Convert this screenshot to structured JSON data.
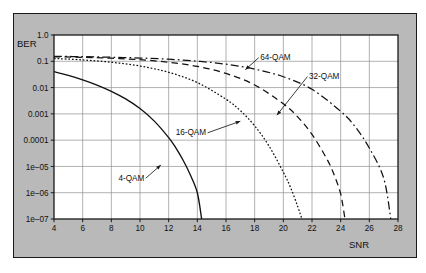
{
  "figure": {
    "background_color": "#b9b9b9",
    "plot_background_color": "#ffffff",
    "grid_color": "#8f8f8f",
    "axis_color": "#1a1a1a",
    "curve_color": "#111111"
  },
  "chart_data": {
    "type": "line",
    "title": "",
    "xlabel": "SNR",
    "ylabel": "BER",
    "xlim": [
      4,
      28
    ],
    "ylim": [
      1e-07,
      1.0
    ],
    "yscale": "log",
    "grid": true,
    "legend_position": "inline-annotations",
    "xticks": [
      4,
      6,
      8,
      10,
      12,
      14,
      16,
      18,
      20,
      22,
      24,
      26,
      28
    ],
    "xtick_labels": [
      "4",
      "6",
      "8",
      "10",
      "12",
      "14",
      "16",
      "18",
      "20",
      "22",
      "24",
      "26",
      "28"
    ],
    "yticks": [
      1.0,
      0.1,
      0.01,
      0.001,
      0.0001,
      1e-05,
      1e-06,
      1e-07
    ],
    "ytick_labels": [
      "1.0",
      "0.1",
      "0.01",
      "0.001",
      "0.0001",
      "1e–05",
      "1e–06",
      "1e–07"
    ],
    "series": [
      {
        "name": "4-QAM",
        "linestyle": "solid",
        "x": [
          4,
          5,
          6,
          7,
          8,
          9,
          10,
          11,
          12,
          12.5,
          13,
          13.5,
          14,
          14.3
        ],
        "y": [
          0.0404,
          0.029,
          0.0197,
          0.0125,
          0.0072,
          0.0037,
          0.00159,
          0.00053,
          0.000125,
          5.1e-05,
          1.76e-05,
          4.9e-06,
          1e-06,
          1e-07
        ]
      },
      {
        "name": "16-QAM",
        "linestyle": "dotted",
        "x": [
          4,
          6,
          8,
          10,
          12,
          14,
          16,
          17,
          18,
          19,
          20,
          20.5,
          21,
          21.3
        ],
        "y": [
          0.128,
          0.113,
          0.092,
          0.066,
          0.038,
          0.0155,
          0.0036,
          0.00133,
          0.00035,
          6e-05,
          6e-06,
          1.6e-06,
          3e-07,
          1e-07
        ]
      },
      {
        "name": "32-QAM",
        "linestyle": "dashed",
        "x": [
          4,
          6,
          8,
          10,
          12,
          14,
          16,
          18,
          20,
          21,
          22,
          23,
          23.5,
          24,
          24.3
        ],
        "y": [
          0.148,
          0.142,
          0.131,
          0.115,
          0.092,
          0.064,
          0.0345,
          0.0126,
          0.0024,
          0.00077,
          0.000165,
          2.1e-05,
          5.5e-06,
          9e-07,
          1e-07
        ]
      },
      {
        "name": "64-QAM",
        "linestyle": "dashdot",
        "x": [
          4,
          6,
          8,
          10,
          12,
          14,
          16,
          18,
          20,
          22,
          24,
          25,
          26,
          27,
          27.5
        ],
        "y": [
          0.155,
          0.15,
          0.143,
          0.133,
          0.12,
          0.101,
          0.0775,
          0.0505,
          0.0258,
          0.0086,
          0.00125,
          0.00033,
          5e-05,
          3.6e-06,
          1e-07
        ]
      }
    ],
    "annotations": [
      {
        "label": "64-QAM",
        "text_x": 19.45,
        "text_y_dec": 0.96,
        "arrow_to_x": 17.35,
        "arrow_to_y_dec": 1.32
      },
      {
        "label": "32-QAM",
        "text_x": 22.85,
        "text_y_dec": 1.68,
        "arrow_to_x": 19.55,
        "arrow_to_y_dec": 3.05
      },
      {
        "label": "16-QAM",
        "text_x": 13.55,
        "text_y_dec": 3.82,
        "arrow_to_x": 17.0,
        "arrow_to_y_dec": 3.28
      },
      {
        "label": "4-QAM",
        "text_x": 9.4,
        "text_y_dec": 5.55,
        "arrow_to_x": 11.45,
        "arrow_to_y_dec": 4.95
      }
    ]
  }
}
